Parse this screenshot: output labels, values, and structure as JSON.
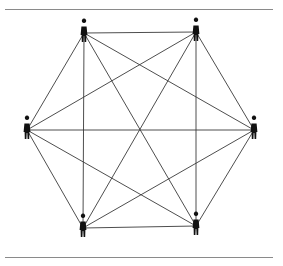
{
  "diagram": {
    "type": "complete-graph",
    "colors": {
      "edge": "#3a3a3a",
      "node": "#111111",
      "rule": "#8a8a8a",
      "background": "#ffffff"
    },
    "nodes": [
      {
        "id": "top-left",
        "x": 84,
        "y": 33
      },
      {
        "id": "top-right",
        "x": 196,
        "y": 32
      },
      {
        "id": "right",
        "x": 254,
        "y": 130
      },
      {
        "id": "bottom-right",
        "x": 196,
        "y": 226
      },
      {
        "id": "bottom-left",
        "x": 83,
        "y": 228
      },
      {
        "id": "left",
        "x": 27,
        "y": 130
      }
    ],
    "edges": [
      [
        0,
        1
      ],
      [
        0,
        2
      ],
      [
        0,
        3
      ],
      [
        0,
        4
      ],
      [
        0,
        5
      ],
      [
        1,
        2
      ],
      [
        1,
        3
      ],
      [
        1,
        4
      ],
      [
        1,
        5
      ],
      [
        2,
        3
      ],
      [
        2,
        4
      ],
      [
        2,
        5
      ],
      [
        3,
        4
      ],
      [
        3,
        5
      ],
      [
        4,
        5
      ]
    ],
    "node_count": 6,
    "edge_count": 15
  }
}
